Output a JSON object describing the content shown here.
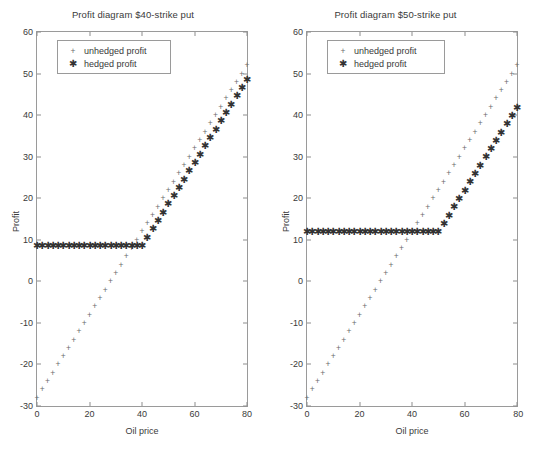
{
  "figure": {
    "background": "#ffffff",
    "axis_color": "#9a9a9a",
    "unhedged_color": "#6b6b6b",
    "hedged_color": "#333333"
  },
  "charts": [
    {
      "id": "chart-left",
      "title": "Profit diagram $40-strike put",
      "xlabel": "Oil price",
      "ylabel": "Profit",
      "xticks": [
        "0",
        "20",
        "40",
        "60",
        "80"
      ],
      "yticks": [
        "60",
        "50",
        "40",
        "30",
        "20",
        "10",
        "0",
        "-10",
        "-20",
        "-30"
      ],
      "legend": [
        {
          "label": "unhedged profit",
          "marker": "plus"
        },
        {
          "label": "hedged profit",
          "marker": "star"
        }
      ]
    },
    {
      "id": "chart-right",
      "title": "Profit diagram $50-strike put",
      "xlabel": "Oil price",
      "ylabel": "Profit",
      "xticks": [
        "0",
        "20",
        "40",
        "60",
        "80"
      ],
      "yticks": [
        "60",
        "50",
        "40",
        "30",
        "20",
        "10",
        "0",
        "-10",
        "-20",
        "-30"
      ],
      "legend": [
        {
          "label": "unhedged profit",
          "marker": "plus"
        },
        {
          "label": "hedged profit",
          "marker": "star"
        }
      ]
    }
  ],
  "chart_data": [
    {
      "type": "scatter",
      "title": "Profit diagram $40-strike put",
      "xlabel": "Oil price",
      "ylabel": "Profit",
      "xlim": [
        0,
        80
      ],
      "ylim": [
        -30,
        60
      ],
      "xticks": [
        0,
        20,
        40,
        60,
        80
      ],
      "yticks": [
        -30,
        -20,
        -10,
        0,
        10,
        20,
        30,
        40,
        50,
        60
      ],
      "grid": false,
      "legend_position": "upper left",
      "x": [
        0,
        2,
        4,
        6,
        8,
        10,
        12,
        14,
        16,
        18,
        20,
        22,
        24,
        26,
        28,
        30,
        32,
        34,
        36,
        38,
        40,
        42,
        44,
        46,
        48,
        50,
        52,
        54,
        56,
        58,
        60,
        62,
        64,
        66,
        68,
        70,
        72,
        74,
        76,
        78,
        80
      ],
      "series": [
        {
          "name": "unhedged profit",
          "marker": "plus",
          "color": "#6b6b6b",
          "values": [
            -28,
            -26,
            -24,
            -22,
            -20,
            -18,
            -16,
            -14,
            -12,
            -10,
            -8,
            -6,
            -4,
            -2,
            0,
            2,
            4,
            6,
            8,
            10,
            12,
            14,
            16,
            18,
            20,
            22,
            24,
            26,
            28,
            30,
            32,
            34,
            36,
            38,
            40,
            42,
            44,
            46,
            48,
            50,
            52
          ]
        },
        {
          "name": "hedged profit",
          "marker": "star",
          "color": "#333333",
          "values": [
            8.5,
            8.5,
            8.5,
            8.5,
            8.5,
            8.5,
            8.5,
            8.5,
            8.5,
            8.5,
            8.5,
            8.5,
            8.5,
            8.5,
            8.5,
            8.5,
            8.5,
            8.5,
            8.5,
            8.5,
            8.5,
            10.5,
            12.5,
            14.5,
            16.5,
            18.5,
            20.5,
            22.5,
            24.5,
            26.5,
            28.5,
            30.5,
            32.5,
            34.5,
            36.5,
            38.5,
            40.5,
            42.5,
            44.5,
            46.5,
            48.5
          ]
        }
      ]
    },
    {
      "type": "scatter",
      "title": "Profit diagram $50-strike put",
      "xlabel": "Oil price",
      "ylabel": "Profit",
      "xlim": [
        0,
        80
      ],
      "ylim": [
        -30,
        60
      ],
      "xticks": [
        0,
        20,
        40,
        60,
        80
      ],
      "yticks": [
        -30,
        -20,
        -10,
        0,
        10,
        20,
        30,
        40,
        50,
        60
      ],
      "grid": false,
      "legend_position": "upper left",
      "x": [
        0,
        2,
        4,
        6,
        8,
        10,
        12,
        14,
        16,
        18,
        20,
        22,
        24,
        26,
        28,
        30,
        32,
        34,
        36,
        38,
        40,
        42,
        44,
        46,
        48,
        50,
        52,
        54,
        56,
        58,
        60,
        62,
        64,
        66,
        68,
        70,
        72,
        74,
        76,
        78,
        80
      ],
      "series": [
        {
          "name": "unhedged profit",
          "marker": "plus",
          "color": "#6b6b6b",
          "values": [
            -28,
            -26,
            -24,
            -22,
            -20,
            -18,
            -16,
            -14,
            -12,
            -10,
            -8,
            -6,
            -4,
            -2,
            0,
            2,
            4,
            6,
            8,
            10,
            12,
            14,
            16,
            18,
            20,
            22,
            24,
            26,
            28,
            30,
            32,
            34,
            36,
            38,
            40,
            42,
            44,
            46,
            48,
            50,
            52
          ]
        },
        {
          "name": "hedged profit",
          "marker": "star",
          "color": "#333333",
          "values": [
            11.8,
            11.8,
            11.8,
            11.8,
            11.8,
            11.8,
            11.8,
            11.8,
            11.8,
            11.8,
            11.8,
            11.8,
            11.8,
            11.8,
            11.8,
            11.8,
            11.8,
            11.8,
            11.8,
            11.8,
            11.8,
            11.8,
            11.8,
            11.8,
            11.8,
            11.8,
            13.8,
            15.8,
            17.8,
            19.8,
            21.8,
            23.8,
            25.8,
            27.8,
            29.8,
            31.8,
            33.8,
            35.8,
            37.8,
            39.8,
            41.8
          ]
        }
      ]
    }
  ]
}
